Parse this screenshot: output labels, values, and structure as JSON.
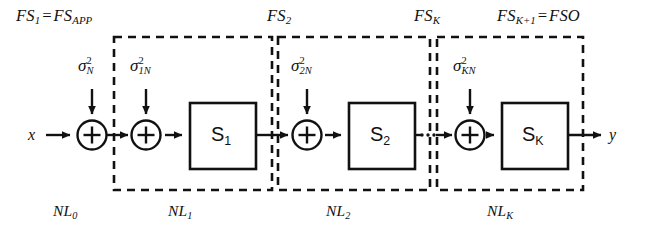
{
  "figure": {
    "type": "block-diagram",
    "background": "#ffffff",
    "ink": "#111111"
  },
  "io": {
    "input_label": "x",
    "output_label": "y"
  },
  "top_labels": [
    {
      "name": "fs1",
      "base": "FS",
      "sub": "1",
      "eq": "=",
      "base2": "FS",
      "sub2": "APP",
      "text": "FS1 = FSAPP"
    },
    {
      "name": "fs2",
      "base": "FS",
      "sub": "2",
      "text": "FS2"
    },
    {
      "name": "fsk",
      "base": "FS",
      "sub": "K",
      "text": "FSK"
    },
    {
      "name": "fsk1",
      "base": "FS",
      "sub": "K+1",
      "eq": "=",
      "base2": "FSO",
      "text": "FSK+1 = FSO"
    }
  ],
  "noise_labels": [
    {
      "name": "sigma-n",
      "glyph": "σ",
      "sup": "2",
      "sub": "N"
    },
    {
      "name": "sigma-1n",
      "glyph": "σ",
      "sup": "2",
      "sub": "1N"
    },
    {
      "name": "sigma-2n",
      "glyph": "σ",
      "sup": "2",
      "sub": "2N"
    },
    {
      "name": "sigma-kn",
      "glyph": "σ",
      "sup": "2",
      "sub": "KN"
    }
  ],
  "blocks": [
    {
      "name": "block-s1",
      "base": "S",
      "sub": "1"
    },
    {
      "name": "block-s2",
      "base": "S",
      "sub": "2"
    },
    {
      "name": "block-sk",
      "base": "S",
      "sub": "K"
    }
  ],
  "bottom_labels": [
    {
      "name": "nl0",
      "base": "NL",
      "sub": "0"
    },
    {
      "name": "nl1",
      "base": "NL",
      "sub": "1"
    },
    {
      "name": "nl2",
      "base": "NL",
      "sub": "2"
    },
    {
      "name": "nlk",
      "base": "NL",
      "sub": "K"
    }
  ],
  "adders": [
    {
      "name": "adder-0",
      "symbol": "+"
    },
    {
      "name": "adder-1",
      "symbol": "+"
    },
    {
      "name": "adder-2",
      "symbol": "+"
    },
    {
      "name": "adder-k",
      "symbol": "+"
    }
  ],
  "ellipsis": {
    "name": "cascade-ellipsis",
    "text": "···"
  }
}
